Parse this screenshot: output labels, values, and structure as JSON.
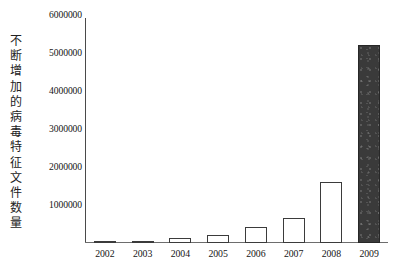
{
  "chart_data": {
    "type": "bar",
    "title": "",
    "subtitle": "",
    "xlabel": "",
    "ylabel": "不断增加的病毒特征文件数量",
    "categories": [
      "2002",
      "2003",
      "2004",
      "2005",
      "2006",
      "2007",
      "2008",
      "2009"
    ],
    "values": [
      20000,
      60000,
      130000,
      210000,
      420000,
      660000,
      1600000,
      5200000
    ],
    "ylim": [
      0,
      6000000
    ],
    "ytick_labels": [
      "6000000",
      "5000000",
      "4000000",
      "3000000",
      "2000000",
      "1000000"
    ],
    "ytick_values": [
      6000000,
      5000000,
      4000000,
      3000000,
      2000000,
      1000000
    ],
    "grid": false,
    "legend": "none",
    "bar_styles": [
      "hollow",
      "hollow",
      "hollow",
      "hollow",
      "hollow",
      "hollow",
      "hollow",
      "filled"
    ],
    "colors": {
      "bar_hollow_fill": "#ffffff",
      "bar_hollow_edge": "#3b3b3b",
      "bar_filled_fill": "#3a3a3a",
      "bar_filled_edge": "#272727",
      "axis": "#4a4a4a",
      "text": "#151515",
      "background": "#ffffff"
    }
  },
  "y_axis_title_chars": [
    "不",
    "断",
    "增",
    "加",
    "的",
    "病",
    "毒",
    "特",
    "征",
    "文",
    "件",
    "数",
    "量"
  ]
}
